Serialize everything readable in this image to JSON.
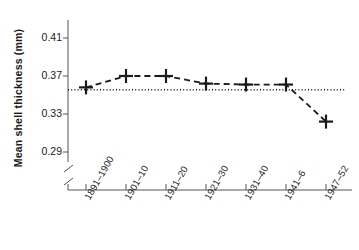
{
  "chart_data": {
    "type": "line",
    "title": "",
    "subtitle": "",
    "xlabel": "",
    "ylabel": "Mean shell thickness (mm)",
    "categories": [
      "1891–1900",
      "1901–10",
      "1911–20",
      "1921–30",
      "1931–40",
      "1941–6",
      "1947–52"
    ],
    "values": [
      0.358,
      0.37,
      0.37,
      0.362,
      0.361,
      0.361,
      0.322
    ],
    "series": [
      {
        "name": "Mean shell thickness",
        "values": [
          0.358,
          0.37,
          0.37,
          0.362,
          0.361,
          0.361,
          0.322
        ]
      }
    ],
    "ylim": [
      0.27,
      0.425
    ],
    "ytick_values": [
      0.41,
      0.37,
      0.33,
      0.29
    ],
    "ytick_labels": [
      "0.41",
      "0.37",
      "0.33",
      "0.29"
    ],
    "grid": false,
    "legend": "none",
    "marker_style": "plus",
    "line_style": "dashed",
    "axis_break": true,
    "axis_break_note": "y-axis broken below 0.29",
    "reference_line": {
      "label": "",
      "value": 0.3555,
      "style": "dotted",
      "orientation": "horizontal"
    },
    "colors": {
      "line": "#1a1a1a",
      "marker": "#1a1a1a",
      "reference_line": "#1a1a1a",
      "axis": "#555555",
      "background": "#ffffff"
    }
  }
}
